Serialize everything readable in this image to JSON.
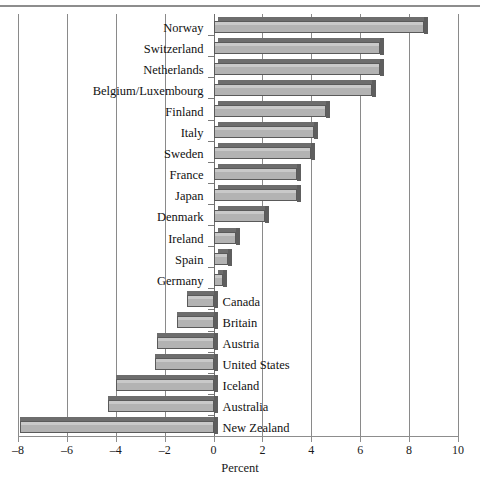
{
  "chart_data": {
    "type": "bar",
    "orientation": "horizontal",
    "title": "",
    "xlabel": "Percent",
    "ylabel": "",
    "xlim": [
      -8,
      10
    ],
    "xticks": [
      -8,
      -6,
      -4,
      -2,
      0,
      2,
      4,
      6,
      8,
      10
    ],
    "xtick_labels": [
      "-8",
      "-6",
      "-4",
      "-2",
      "0",
      "2",
      "4",
      "6",
      "8",
      "10"
    ],
    "grid": true,
    "legend": null,
    "categories": [
      "Norway",
      "Switzerland",
      "Netherlands",
      "Belgium/Luxembourg",
      "Finland",
      "Italy",
      "Sweden",
      "France",
      "Japan",
      "Denmark",
      "Ireland",
      "Spain",
      "Germany",
      "Canada",
      "Britain",
      "Austria",
      "United States",
      "Iceland",
      "Australia",
      "New Zealand"
    ],
    "values": [
      8.6,
      6.8,
      6.8,
      6.5,
      4.6,
      4.1,
      4.0,
      3.4,
      3.4,
      2.1,
      0.9,
      0.6,
      0.4,
      -1.1,
      -1.5,
      -2.3,
      -2.4,
      -4.0,
      -4.3,
      -7.9
    ],
    "colors": {
      "bar_fill": "#b3b3b3",
      "bar_edge": "#5a5a5a",
      "bar_bevel": "#6d6d6d",
      "gridline": "#8a8a8a",
      "axis": "#8d8d8d",
      "text": "#111111",
      "background": "#ffffff"
    }
  }
}
